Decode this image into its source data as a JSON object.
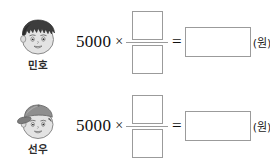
{
  "page": {
    "background_color": "#ffffff",
    "line_color": "#9b9b9b",
    "text_color": "#111111"
  },
  "problems": [
    {
      "student": {
        "name": "민호",
        "avatar": "boy-spiky-hair-face-icon"
      },
      "equation": {
        "multiplicand": "5000",
        "times_symbol": "×",
        "numerator": "",
        "denominator": "",
        "equals_symbol": "=",
        "answer": "",
        "unit": "(원)"
      }
    },
    {
      "student": {
        "name": "선우",
        "avatar": "boy-with-cap-face-icon"
      },
      "equation": {
        "multiplicand": "5000",
        "times_symbol": "×",
        "numerator": "",
        "denominator": "",
        "equals_symbol": "=",
        "answer": "",
        "unit": "(원)"
      }
    }
  ]
}
